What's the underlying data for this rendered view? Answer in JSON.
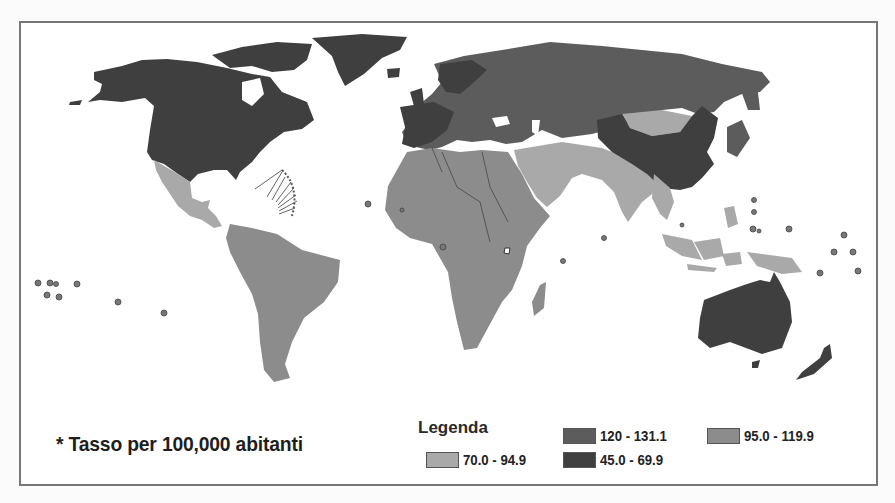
{
  "map": {
    "footnote": "* Tasso per 100,000 abitanti",
    "legend": {
      "title": "Legenda",
      "items": [
        {
          "label": "120 - 131.1",
          "color": "#5c5c5c"
        },
        {
          "label": "95.0 - 119.9",
          "color": "#8c8c8c"
        },
        {
          "label": "70.0 - 94.9",
          "color": "#a9a9a9"
        },
        {
          "label": "45.0 - 69.9",
          "color": "#3f3f3f"
        }
      ]
    },
    "regions": [
      {
        "name": "North America (USA, Canada, Greenland)",
        "class": "45.0 - 69.9",
        "color": "#3f3f3f"
      },
      {
        "name": "Europe and Russia",
        "class": "120 - 131.1",
        "color": "#5c5c5c"
      },
      {
        "name": "China",
        "class": "45.0 - 69.9",
        "color": "#3f3f3f"
      },
      {
        "name": "Australia",
        "class": "45.0 - 69.9",
        "color": "#3f3f3f"
      },
      {
        "name": "Japan",
        "class": "120 - 131.1",
        "color": "#5c5c5c"
      },
      {
        "name": "Mexico and Central America",
        "class": "70.0 - 94.9",
        "color": "#a9a9a9"
      },
      {
        "name": "South America",
        "class": "95.0 - 119.9",
        "color": "#8c8c8c"
      },
      {
        "name": "Africa",
        "class": "95.0 - 119.9",
        "color": "#8c8c8c"
      },
      {
        "name": "Middle East, South and Southeast Asia",
        "class": "70.0 - 94.9",
        "color": "#a9a9a9"
      },
      {
        "name": "Mongolia",
        "class": "70.0 - 94.9",
        "color": "#a9a9a9"
      }
    ]
  }
}
